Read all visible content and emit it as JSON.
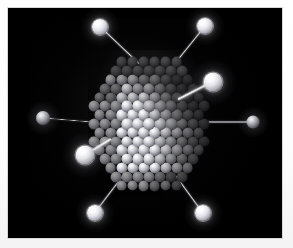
{
  "figure": {
    "alt_text": "A faceted polyhedral nanoparticle built from many closely packed grey spheres, set on a black background and surrounded by eight smaller satellite spheres connected to its surface by thin straight bonds.",
    "background_color": "#000000",
    "mat_color": "#ffffff",
    "plate": {
      "x": 8,
      "y": 8,
      "width": 274,
      "height": 230
    }
  },
  "nanoparticle": {
    "label": "nanoparticle-core",
    "shape": "faceted hexagonal polyhedron",
    "center": {
      "x": 141,
      "y": 116
    },
    "width": 118,
    "height": 140,
    "atom_count": 137,
    "atom_radius": 6.0,
    "lattice_spacing": 11,
    "atom_color": "#cfcfd6",
    "highlight_color": "#ffffff",
    "shadow_color": "#2a2a31"
  },
  "ligands": [
    {
      "name": "ligand-top-left",
      "x": 100,
      "y": 27,
      "r": 8.0,
      "brightness": "bright",
      "bond": {
        "to_x": 139,
        "to_y": 64,
        "thickness": 1.6,
        "style": "thin"
      }
    },
    {
      "name": "ligand-top-right",
      "x": 205,
      "y": 26,
      "r": 8.0,
      "brightness": "bright",
      "bond": {
        "to_x": 176,
        "to_y": 62,
        "thickness": 1.6,
        "style": "thin"
      }
    },
    {
      "name": "ligand-upper-right",
      "x": 213,
      "y": 82,
      "r": 9.5,
      "brightness": "bright",
      "bond": {
        "to_x": 178,
        "to_y": 100,
        "thickness": 3.2,
        "style": "thick"
      }
    },
    {
      "name": "ligand-right",
      "x": 253,
      "y": 122,
      "r": 6.5,
      "brightness": "dim",
      "bond": {
        "to_x": 199,
        "to_y": 122,
        "thickness": 1.4,
        "style": "thin"
      }
    },
    {
      "name": "ligand-left",
      "x": 43,
      "y": 118,
      "r": 7.0,
      "brightness": "dim",
      "bond": {
        "to_x": 90,
        "to_y": 122,
        "thickness": 1.4,
        "style": "thin"
      }
    },
    {
      "name": "ligand-lower-left",
      "x": 85,
      "y": 155,
      "r": 9.5,
      "brightness": "bright",
      "bond": {
        "to_x": 111,
        "to_y": 139,
        "thickness": 3.2,
        "style": "thick"
      }
    },
    {
      "name": "ligand-bottom-left",
      "x": 95,
      "y": 213,
      "r": 8.0,
      "brightness": "bright",
      "bond": {
        "to_x": 124,
        "to_y": 175,
        "thickness": 1.5,
        "style": "thin"
      }
    },
    {
      "name": "ligand-bottom-right",
      "x": 203,
      "y": 213,
      "r": 8.0,
      "brightness": "bright",
      "bond": {
        "to_x": 176,
        "to_y": 176,
        "thickness": 1.5,
        "style": "thin"
      }
    }
  ],
  "colors": {
    "plate_black": "#000000",
    "mat_white": "#ffffff",
    "sphere_light": "#ffffff",
    "sphere_mid": "#9a9aa3",
    "sphere_dark": "#2a2a31"
  }
}
